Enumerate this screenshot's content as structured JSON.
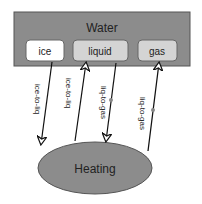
{
  "diagram": {
    "container": {
      "title": "Water",
      "fill": "#8c8c8c"
    },
    "states": [
      {
        "id": "ice",
        "label": "ice",
        "fill": "#ffffff"
      },
      {
        "id": "liquid",
        "label": "liquid",
        "fill": "#d4d4d4"
      },
      {
        "id": "gas",
        "label": "gas",
        "fill": "#d4d4d4"
      }
    ],
    "process": {
      "label": "Heating",
      "fill": "#8c8c8c"
    },
    "edges": [
      {
        "from": "ice",
        "to": "Heating",
        "label": "ice-to-liq"
      },
      {
        "from": "Heating",
        "to": "liquid",
        "label": "ice-to-liq"
      },
      {
        "from": "liquid",
        "to": "Heating",
        "label": "liq-to-gas"
      },
      {
        "from": "Heating",
        "to": "gas",
        "label": "liq-to-gas"
      }
    ]
  }
}
